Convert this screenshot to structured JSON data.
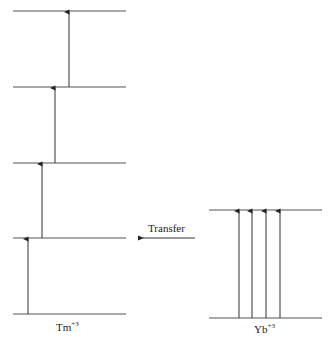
{
  "diagram": {
    "type": "energy-level-diagram",
    "colors": {
      "line": "#555555",
      "arrow": "#333333",
      "text": "#222222"
    },
    "tm": {
      "species": "Tm",
      "charge": "+3",
      "levels_y": [
        314,
        238,
        163,
        87,
        11
      ],
      "level_x": [
        13,
        126
      ],
      "arrows": [
        {
          "x": 28,
          "from": 314,
          "to": 238
        },
        {
          "x": 42,
          "from": 238,
          "to": 163
        },
        {
          "x": 55,
          "from": 163,
          "to": 87
        },
        {
          "x": 69,
          "from": 87,
          "to": 11
        }
      ]
    },
    "yb": {
      "species": "Yb",
      "charge": "+3",
      "levels_y": [
        318,
        210
      ],
      "level_x": [
        209,
        322
      ],
      "arrows": [
        {
          "x": 239,
          "from": 318,
          "to": 210
        },
        {
          "x": 252,
          "from": 318,
          "to": 210
        },
        {
          "x": 266,
          "from": 318,
          "to": 210
        },
        {
          "x": 280,
          "from": 318,
          "to": 210
        }
      ]
    },
    "transfer": {
      "label": "Transfer",
      "x1": 195,
      "x2": 143,
      "y": 238
    }
  }
}
